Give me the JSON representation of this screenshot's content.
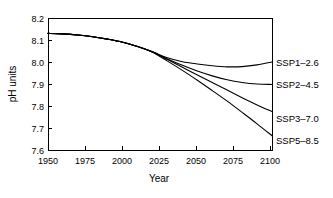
{
  "chart_data": {
    "type": "line",
    "title": "",
    "xlabel": "Year",
    "ylabel": "pH units",
    "xlim": [
      1950,
      2100
    ],
    "ylim": [
      7.6,
      8.2
    ],
    "grid": false,
    "legend_position": "right-of-axes-inline",
    "xticks": [
      "1950",
      "1975",
      "2000",
      "2025",
      "2050",
      "2075",
      "2100"
    ],
    "xtick_values": [
      1950,
      1975,
      2000,
      2025,
      2050,
      2075,
      2100
    ],
    "yticks": [
      "8.2",
      "8.1",
      "8.0",
      "7.9",
      "7.8",
      "7.7",
      "7.6"
    ],
    "ytick_values": [
      8.2,
      8.1,
      8.0,
      7.9,
      7.8,
      7.7,
      7.6
    ],
    "x": [
      1950,
      1960,
      1970,
      1980,
      1990,
      2000,
      2010,
      2020,
      2030,
      2040,
      2050,
      2060,
      2070,
      2080,
      2090,
      2100
    ],
    "series": [
      {
        "name": "SSP1–2.6",
        "label": "SSP1-2.6",
        "color": "#000000",
        "values": [
          8.13,
          8.128,
          8.123,
          8.115,
          8.104,
          8.09,
          8.07,
          8.046,
          8.019,
          8.001,
          7.991,
          7.983,
          7.978,
          7.979,
          7.987,
          8.0
        ]
      },
      {
        "name": "SSP2–4.5",
        "label": "SSP2-4.5",
        "color": "#000000",
        "values": [
          8.13,
          8.128,
          8.123,
          8.115,
          8.104,
          8.09,
          8.07,
          8.046,
          8.014,
          7.985,
          7.959,
          7.937,
          7.919,
          7.907,
          7.9,
          7.898
        ]
      },
      {
        "name": "SSP3–7.0",
        "label": "SSP3-7.0",
        "color": "#000000",
        "values": [
          8.13,
          8.128,
          8.123,
          8.115,
          8.104,
          8.09,
          8.07,
          8.046,
          8.011,
          7.976,
          7.941,
          7.907,
          7.873,
          7.838,
          7.805,
          7.775
        ]
      },
      {
        "name": "SSP5–8.5",
        "label": "SSP5-8.5",
        "color": "#000000",
        "values": [
          8.13,
          8.128,
          8.123,
          8.115,
          8.104,
          8.09,
          8.07,
          8.044,
          8.004,
          7.962,
          7.917,
          7.87,
          7.822,
          7.771,
          7.719,
          7.665
        ]
      }
    ]
  },
  "axes": {
    "ylabel": "pH units",
    "xlabel": "Year"
  },
  "labels": {
    "ssp1": "SSP1–2.6",
    "ssp2": "SSP2–4.5",
    "ssp3": "SSP3–7.0",
    "ssp5": "SSP5–8.5"
  },
  "yticks": {
    "t0": "8.2",
    "t1": "8.1",
    "t2": "8.0",
    "t3": "7.9",
    "t4": "7.8",
    "t5": "7.7",
    "t6": "7.6"
  },
  "xticks": {
    "t0": "1950",
    "t1": "1975",
    "t2": "2000",
    "t3": "2025",
    "t4": "2050",
    "t5": "2075",
    "t6": "2100"
  }
}
